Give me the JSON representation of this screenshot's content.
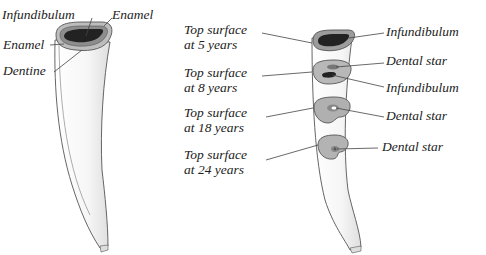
{
  "left_tooth": {
    "labels": {
      "infundibulum": "Infundibulum",
      "enamel_outer": "Enamel",
      "enamel_inner": "Enamel",
      "dentine": "Dentine"
    }
  },
  "right_tooth": {
    "surfaces": [
      {
        "line1": "Top surface",
        "line2": "at 5 years"
      },
      {
        "line1": "Top surface",
        "line2": "at 8 years"
      },
      {
        "line1": "Top surface",
        "line2": "at 18 years"
      },
      {
        "line1": "Top surface",
        "line2": "at 24 years"
      }
    ],
    "right_labels": [
      "Infundibulum",
      "Dental star",
      "Infundibulum",
      "Dental star",
      "Dental star"
    ]
  },
  "colors": {
    "outline": "#555555",
    "tooth_fill": "#f4f4f4",
    "enamel_ring": "#9a9a9a",
    "surface_fill": "#b8b8b8",
    "infundibulum": "#222222"
  }
}
